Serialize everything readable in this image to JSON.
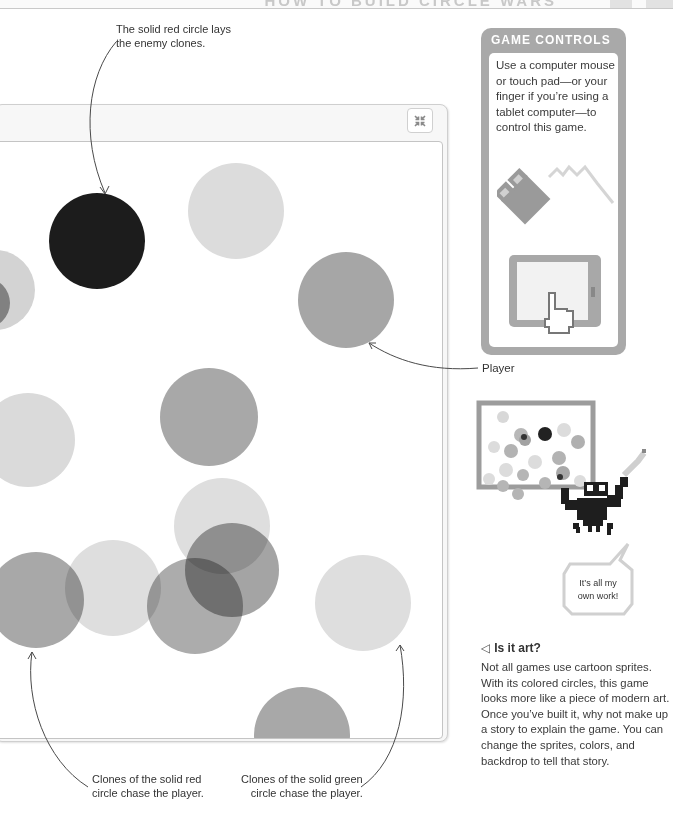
{
  "header": {
    "title": "HOW TO BUILD CIRCLE WARS"
  },
  "annotations": {
    "top": "The solid red circle lays the enemy clones.",
    "top_line1": "The solid red circle lays",
    "top_line2": "the enemy clones.",
    "player": "Player",
    "bottom_left_line1": "Clones of the solid red",
    "bottom_left_line2": "circle chase the player.",
    "bottom_right_line1": "Clones of the solid green",
    "bottom_right_line2": "circle chase the player."
  },
  "stage": {
    "fullscreen_icon": "shrink-arrows-icon",
    "fullscreen_glyph": "⤡",
    "circles": [
      {
        "role": "enemy-red-solid",
        "cx": 97,
        "cy": 241,
        "r": 48,
        "color": "#1c1c1c"
      },
      {
        "role": "light",
        "cx": 236,
        "cy": 211,
        "r": 48,
        "color": "#dcdcdc"
      },
      {
        "role": "player",
        "cx": 346,
        "cy": 300,
        "r": 48,
        "color": "#a6a6a6"
      },
      {
        "role": "light",
        "cx": -5,
        "cy": 290,
        "r": 40,
        "color": "#d3d3d3"
      },
      {
        "role": "mid",
        "cx": -15,
        "cy": 303,
        "r": 25,
        "color": "#9c9c9c"
      },
      {
        "role": "mid",
        "cx": 209,
        "cy": 417,
        "r": 49,
        "color": "#a8a8a8"
      },
      {
        "role": "light",
        "cx": 28,
        "cy": 440,
        "r": 47,
        "color": "#dadada"
      },
      {
        "role": "light",
        "cx": 222,
        "cy": 526,
        "r": 48,
        "color": "#dedede"
      },
      {
        "role": "light",
        "cx": 113,
        "cy": 588,
        "r": 48,
        "color": "#dedede"
      },
      {
        "role": "light",
        "cx": 363,
        "cy": 603,
        "r": 48,
        "color": "#dedede"
      },
      {
        "role": "mid",
        "cx": 36,
        "cy": 600,
        "r": 48,
        "color": "#a8a8a8"
      },
      {
        "role": "mid",
        "cx": 232,
        "cy": 570,
        "r": 47,
        "color": "#a4a4a4"
      },
      {
        "role": "mid",
        "cx": 195,
        "cy": 606,
        "r": 48,
        "color": "#acacac"
      },
      {
        "role": "mid",
        "cx": 302,
        "cy": 735,
        "r": 48,
        "color": "#a8a8a8"
      }
    ]
  },
  "controls": {
    "title": "GAME CONTROLS",
    "text": "Use a computer mouse or touch pad—or your finger if you’re using a tablet computer—to control this game.",
    "mouse_icon": "mouse-icon",
    "tablet_icon": "tablet-touch-icon"
  },
  "illustration": {
    "speech": "It’s all my own work!",
    "speech_line1": "It’s all my",
    "speech_line2": "own work!"
  },
  "sidebar": {
    "arrow": "◁",
    "heading": "Is it art?",
    "body": "Not all games use cartoon sprites. With its colored circles, this game looks more like a piece of modern art. Once you’ve built it, why not make up a story to explain the game. You can change the sprites, colors, and backdrop to tell that story."
  },
  "colors": {
    "panel_gray": "#a9a9a9",
    "stage_border": "#c4c4c4",
    "annotation_line": "#555555"
  }
}
